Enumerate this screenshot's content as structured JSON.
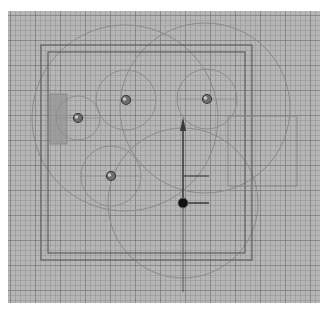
{
  "viewport": {
    "name": "top-orthographic-viewport",
    "background": "#b6b6b6",
    "grid": {
      "minor_spacing_px": 5,
      "major_spacing_px": 25
    }
  },
  "scene": {
    "room_outer": {
      "x": 41,
      "y": 45,
      "w": 211,
      "h": 215
    },
    "room_inner": {
      "x": 48,
      "y": 52,
      "w": 197,
      "h": 201
    },
    "side_rect": {
      "x": 228,
      "y": 116,
      "w": 69,
      "h": 70
    },
    "wall_panel": {
      "x": 50,
      "y": 94,
      "w": 17,
      "h": 50
    },
    "lights": [
      {
        "id": "light-1",
        "x": 78,
        "y": 118,
        "radius": 22
      },
      {
        "id": "light-2",
        "x": 126,
        "y": 100,
        "radius": 30
      },
      {
        "id": "light-3",
        "x": 207,
        "y": 99,
        "radius": 30
      },
      {
        "id": "light-4",
        "x": 111,
        "y": 176,
        "radius": 30
      }
    ],
    "influence_circles": [
      {
        "cx": 125,
        "cy": 118,
        "r": 93
      },
      {
        "cx": 205,
        "cy": 108,
        "r": 85
      },
      {
        "cx": 183,
        "cy": 203,
        "r": 75
      }
    ],
    "gizmo": {
      "x": 183,
      "y": 203,
      "arrow_tip_y": 117,
      "handle_len": 26
    }
  }
}
